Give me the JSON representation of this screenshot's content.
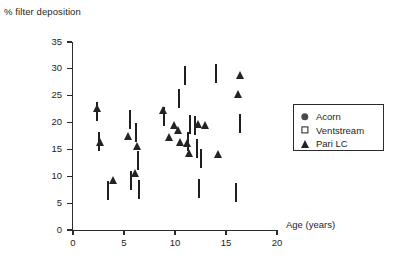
{
  "chart_data": {
    "type": "scatter",
    "title": "",
    "ylabel": "% filter deposition",
    "xlabel": "Age (years)",
    "xlim": [
      0,
      20
    ],
    "ylim": [
      0,
      35
    ],
    "xticks": [
      0,
      5,
      10,
      15,
      20
    ],
    "yticks": [
      0,
      5,
      10,
      15,
      20,
      25,
      30,
      35
    ],
    "grid": false,
    "legend_position": "right",
    "series": [
      {
        "name": "Acorn",
        "marker": "filled-circle",
        "color": "#4a4a4a",
        "points": [
          [
            3.0,
            13.8
          ],
          [
            3.7,
            9.0
          ],
          [
            4.0,
            3.2
          ],
          [
            5.5,
            6.1
          ],
          [
            5.6,
            5.8
          ],
          [
            5.8,
            8.4
          ],
          [
            6.2,
            11.0
          ],
          [
            6.4,
            11.1
          ],
          [
            8.0,
            10.8
          ],
          [
            9.0,
            10.8
          ],
          [
            10.2,
            13.1
          ],
          [
            11.1,
            9.6
          ],
          [
            11.5,
            9.3
          ],
          [
            11.8,
            9.2
          ],
          [
            12.3,
            9.6
          ],
          [
            14.0,
            12.3
          ],
          [
            15.6,
            13.0
          ],
          [
            16.3,
            12.6
          ]
        ]
      },
      {
        "name": "Ventstream",
        "marker": "open-square",
        "color": "#1f1f1f",
        "points": [
          [
            2.4,
            21.9
          ],
          [
            2.5,
            16.4
          ],
          [
            3.4,
            7.2
          ],
          [
            5.6,
            20.5
          ],
          [
            5.7,
            9.2
          ],
          [
            6.2,
            18.0
          ],
          [
            6.4,
            12.8
          ],
          [
            6.5,
            7.5
          ],
          [
            8.9,
            21.1
          ],
          [
            10.4,
            24.4
          ],
          [
            11.0,
            28.6
          ],
          [
            11.3,
            16.3
          ],
          [
            11.5,
            19.5
          ],
          [
            12.0,
            19.3
          ],
          [
            12.2,
            15.0
          ],
          [
            12.4,
            7.6
          ],
          [
            12.5,
            13.2
          ],
          [
            14.0,
            29.0
          ],
          [
            16.0,
            6.8
          ],
          [
            16.4,
            19.8
          ]
        ]
      },
      {
        "name": "Pari LC",
        "marker": "filled-triangle",
        "color": "#232323",
        "points": [
          [
            2.4,
            25.0
          ],
          [
            2.6,
            18.6
          ],
          [
            3.9,
            11.6
          ],
          [
            5.4,
            19.8
          ],
          [
            6.1,
            12.8
          ],
          [
            6.3,
            17.9
          ],
          [
            8.8,
            24.6
          ],
          [
            9.4,
            19.6
          ],
          [
            9.9,
            21.8
          ],
          [
            10.3,
            20.9
          ],
          [
            10.5,
            18.6
          ],
          [
            11.2,
            18.5
          ],
          [
            11.4,
            16.6
          ],
          [
            12.3,
            22.0
          ],
          [
            12.9,
            21.7
          ],
          [
            14.2,
            16.3
          ],
          [
            16.2,
            27.6
          ],
          [
            16.4,
            31.0
          ]
        ]
      }
    ]
  },
  "legend": {
    "items": [
      {
        "label": "Acorn",
        "marker": "filled-circle"
      },
      {
        "label": "Ventstream",
        "marker": "open-square"
      },
      {
        "label": "Pari LC",
        "marker": "filled-triangle"
      }
    ]
  }
}
